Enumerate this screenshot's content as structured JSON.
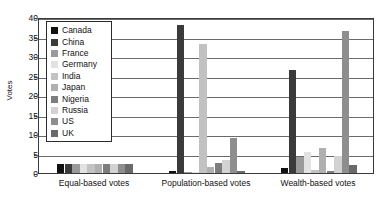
{
  "chart_data": {
    "type": "bar",
    "title": "",
    "xlabel": "",
    "ylabel": "Votes",
    "ylim": [
      0,
      40
    ],
    "yticks": [
      0,
      5,
      10,
      15,
      20,
      25,
      30,
      35,
      40
    ],
    "grid": true,
    "legend_position": "top-left-inside",
    "categories": [
      "Equal-based votes",
      "Population-based votes",
      "Wealth-based votes"
    ],
    "series": [
      {
        "name": "Canada",
        "color": "#111111",
        "values": [
          2.2,
          0.4,
          1.2
        ]
      },
      {
        "name": "China",
        "color": "#3b3b3b",
        "values": [
          2.2,
          38.0,
          26.5
        ]
      },
      {
        "name": "France",
        "color": "#9a9a9a",
        "values": [
          2.2,
          0.3,
          4.0
        ]
      },
      {
        "name": "Germany",
        "color": "#e2e2e2",
        "values": [
          2.2,
          0.3,
          5.5
        ]
      },
      {
        "name": "India",
        "color": "#c2c2c2",
        "values": [
          2.2,
          33.0,
          0.8
        ]
      },
      {
        "name": "Japan",
        "color": "#b0b0b0",
        "values": [
          2.2,
          1.6,
          6.5
        ]
      },
      {
        "name": "Nigeria",
        "color": "#7d7d7d",
        "values": [
          2.2,
          2.6,
          0.6
        ]
      },
      {
        "name": "Russia",
        "color": "#d2d2d2",
        "values": [
          2.2,
          3.4,
          4.3
        ]
      },
      {
        "name": "US",
        "color": "#8e8e8e",
        "values": [
          2.2,
          9.0,
          36.5
        ]
      },
      {
        "name": "UK",
        "color": "#6a6a6a",
        "values": [
          2.2,
          0.4,
          2.0
        ]
      }
    ]
  },
  "axis": {
    "y_title": "Votes",
    "y_tick_labels": [
      "0",
      "5",
      "10",
      "15",
      "20",
      "25",
      "30",
      "35",
      "40"
    ],
    "x_tick_labels": [
      "Equal-based votes",
      "Population-based votes",
      "Wealth-based votes"
    ]
  },
  "legend": {
    "entries": [
      {
        "label": "Canada"
      },
      {
        "label": "China"
      },
      {
        "label": "France"
      },
      {
        "label": "Germany"
      },
      {
        "label": "India"
      },
      {
        "label": "Japan"
      },
      {
        "label": "Nigeria"
      },
      {
        "label": "Russia"
      },
      {
        "label": "US"
      },
      {
        "label": "UK"
      }
    ]
  }
}
